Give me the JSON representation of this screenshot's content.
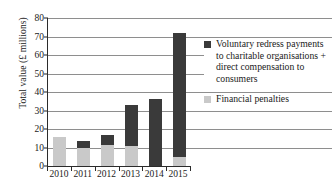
{
  "chart_data": {
    "type": "bar",
    "subtype": "stacked-vertical",
    "title": "",
    "subtitle": "",
    "xlabel": "",
    "ylabel": "Total value (£ millions)",
    "categories": [
      "2010",
      "2011",
      "2012",
      "2013",
      "2014",
      "2015"
    ],
    "ylim": [
      0,
      80
    ],
    "yticks": [
      0,
      10,
      20,
      30,
      40,
      50,
      60,
      70,
      80
    ],
    "ytick_labels": [
      "0",
      "10",
      "20",
      "30",
      "40",
      "50",
      "60",
      "70",
      "80"
    ],
    "grid": "horizontal",
    "legend_position": "right",
    "series": [
      {
        "name": "Voluntary redress payments to charitable organisations + direct compensation to consumers",
        "color": "#3a3a3a",
        "values": [
          0,
          3.5,
          5.5,
          22,
          36,
          67
        ]
      },
      {
        "name": "Financial penalties",
        "color": "#c9c9c9",
        "values": [
          15.5,
          10,
          11.5,
          11,
          0,
          5
        ]
      }
    ],
    "totals": [
      15.5,
      13.5,
      17,
      33,
      36,
      72
    ]
  },
  "legend": {
    "items": [
      {
        "swatch": "dark-square-swatch",
        "label": "Voluntary redress payments to charitable organisations + direct compensation to consumers"
      },
      {
        "swatch": "light-square-swatch",
        "label": "Financial penalties"
      }
    ]
  }
}
